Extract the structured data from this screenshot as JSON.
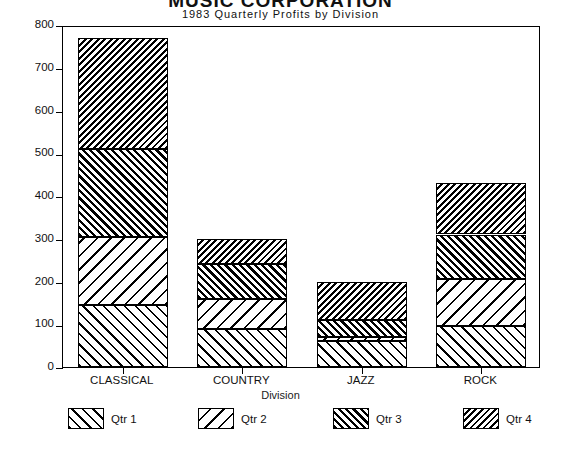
{
  "title": "MUSIC CORPORATION",
  "subtitle": "1983 Quarterly Profits by Division",
  "axis": {
    "ylabel": "Profit ($000)",
    "xlabel": "Division",
    "yticks": [
      "800",
      "700",
      "600",
      "500",
      "400",
      "300",
      "200",
      "100",
      "0"
    ]
  },
  "legend": [
    {
      "label": "Qtr 1",
      "pattern": "h-q1"
    },
    {
      "label": "Qtr 2",
      "pattern": "h-q2"
    },
    {
      "label": "Qtr 3",
      "pattern": "h-q3"
    },
    {
      "label": "Qtr 4",
      "pattern": "h-q4"
    }
  ],
  "categories": [
    "CLASSICAL",
    "COUNTRY",
    "JAZZ",
    "ROCK"
  ],
  "chart_data": {
    "type": "bar",
    "subtype": "stacked-vertical",
    "title": "MUSIC CORPORATION",
    "subtitle": "1983 Quarterly Profits by Division",
    "xlabel": "Division",
    "ylabel": "Profit ($000)",
    "ylim": [
      0,
      800
    ],
    "ytick_step": 100,
    "grid": false,
    "legend_position": "bottom",
    "categories": [
      "CLASSICAL",
      "COUNTRY",
      "JAZZ",
      "ROCK"
    ],
    "series": [
      {
        "name": "Qtr 1",
        "values": [
          145,
          90,
          60,
          95
        ]
      },
      {
        "name": "Qtr 2",
        "values": [
          160,
          70,
          10,
          110
        ]
      },
      {
        "name": "Qtr 3",
        "values": [
          205,
          80,
          40,
          105
        ]
      },
      {
        "name": "Qtr 4",
        "values": [
          260,
          60,
          90,
          120
        ]
      }
    ],
    "totals": [
      770,
      300,
      200,
      430
    ],
    "cumulative": {
      "CLASSICAL": [
        145,
        305,
        510,
        770
      ],
      "COUNTRY": [
        90,
        160,
        240,
        300
      ],
      "JAZZ": [
        60,
        70,
        110,
        200
      ],
      "ROCK": [
        95,
        205,
        310,
        430
      ]
    }
  }
}
